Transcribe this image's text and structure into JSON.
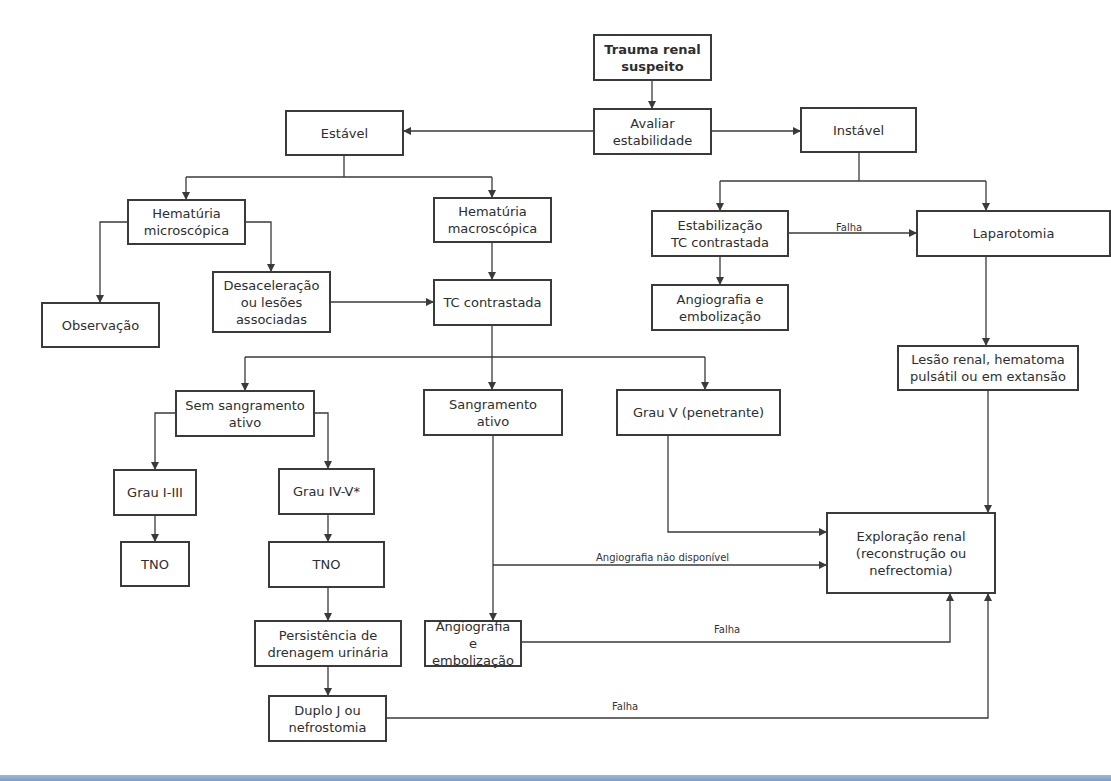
{
  "diagram": {
    "title": "Trauma renal suspeito",
    "nodes": {
      "trauma": {
        "label": "Trauma renal\nsuspeito",
        "x": 593,
        "y": 34,
        "w": 119,
        "h": 47,
        "bold": true
      },
      "avaliar": {
        "label": "Avaliar\nestabilidade",
        "x": 593,
        "y": 108,
        "w": 119,
        "h": 47
      },
      "estavel": {
        "label": "Estável",
        "x": 285,
        "y": 110,
        "w": 119,
        "h": 46
      },
      "instavel": {
        "label": "Instável",
        "x": 800,
        "y": 107,
        "w": 117,
        "h": 46
      },
      "hem_micro": {
        "label": "Hematúria\nmicroscópica",
        "x": 127,
        "y": 199,
        "w": 119,
        "h": 46
      },
      "hem_macro": {
        "label": "Hematúria\nmacroscópica",
        "x": 433,
        "y": 197,
        "w": 119,
        "h": 46
      },
      "observacao": {
        "label": "Observação",
        "x": 41,
        "y": 302,
        "w": 119,
        "h": 46
      },
      "desacel": {
        "label": "Desaceleração\nou lesões\nassociadas",
        "x": 212,
        "y": 271,
        "w": 119,
        "h": 62
      },
      "tc": {
        "label": "TC contrastada",
        "x": 433,
        "y": 279,
        "w": 119,
        "h": 47
      },
      "estab_tc": {
        "label": "Estabilização\nTC contrastada",
        "x": 651,
        "y": 210,
        "w": 138,
        "h": 47
      },
      "laparotomia": {
        "label": "Laparotomia",
        "x": 916,
        "y": 210,
        "w": 195,
        "h": 47
      },
      "angio1": {
        "label": "Angiografia e\nembolização",
        "x": 651,
        "y": 284,
        "w": 138,
        "h": 47
      },
      "lesao": {
        "label": "Lesão renal, hematoma\npulsátil ou em extansão",
        "x": 897,
        "y": 345,
        "w": 182,
        "h": 46
      },
      "sem_sangr": {
        "label": "Sem sangramento\nativo",
        "x": 175,
        "y": 390,
        "w": 140,
        "h": 47
      },
      "sangr_ativo": {
        "label": "Sangramento\nativo",
        "x": 423,
        "y": 389,
        "w": 140,
        "h": 47
      },
      "grau_v": {
        "label": "Grau V (penetrante)",
        "x": 616,
        "y": 389,
        "w": 165,
        "h": 47
      },
      "grau_1_3": {
        "label": "Grau I-III",
        "x": 113,
        "y": 469,
        "w": 84,
        "h": 47
      },
      "grau_4_5": {
        "label": "Grau IV-V*",
        "x": 278,
        "y": 468,
        "w": 97,
        "h": 47
      },
      "tno1": {
        "label": "TNO",
        "x": 120,
        "y": 541,
        "w": 70,
        "h": 46
      },
      "tno2": {
        "label": "TNO",
        "x": 268,
        "y": 541,
        "w": 117,
        "h": 47
      },
      "persist": {
        "label": "Persistência de\ndrenagem urinária",
        "x": 254,
        "y": 620,
        "w": 148,
        "h": 47
      },
      "angio2": {
        "label": "Angiografia e\nembolização",
        "x": 424,
        "y": 620,
        "w": 98,
        "h": 47
      },
      "duplo_j": {
        "label": "Duplo J ou\nnefrostomia",
        "x": 268,
        "y": 695,
        "w": 119,
        "h": 47
      },
      "exploracao": {
        "label": "Exploração renal\n(reconstrução ou\nnefrectomia)",
        "x": 826,
        "y": 512,
        "w": 170,
        "h": 82
      }
    },
    "edges": [
      {
        "id": "trauma-avaliar",
        "points": [
          [
            652,
            81
          ],
          [
            652,
            108
          ]
        ],
        "arrow": true
      },
      {
        "id": "avaliar-estavel",
        "points": [
          [
            593,
            131
          ],
          [
            404,
            131
          ]
        ],
        "arrow": true
      },
      {
        "id": "avaliar-instavel",
        "points": [
          [
            712,
            131
          ],
          [
            800,
            131
          ]
        ],
        "arrow": true
      },
      {
        "id": "estavel-split",
        "points": [
          [
            344,
            156
          ],
          [
            344,
            177
          ]
        ],
        "arrow": false
      },
      {
        "id": "estavel-branch",
        "points": [
          [
            186,
            177
          ],
          [
            492,
            177
          ]
        ],
        "arrow": false
      },
      {
        "id": "to-hem-micro",
        "points": [
          [
            186,
            177
          ],
          [
            186,
            199
          ]
        ],
        "arrow": true
      },
      {
        "id": "to-hem-macro",
        "points": [
          [
            492,
            177
          ],
          [
            492,
            197
          ]
        ],
        "arrow": true
      },
      {
        "id": "micro-obs",
        "points": [
          [
            127,
            222
          ],
          [
            100,
            222
          ],
          [
            100,
            302
          ]
        ],
        "arrow": true
      },
      {
        "id": "micro-desacel",
        "points": [
          [
            246,
            222
          ],
          [
            271,
            222
          ],
          [
            271,
            271
          ]
        ],
        "arrow": true
      },
      {
        "id": "desacel-tc",
        "points": [
          [
            331,
            302
          ],
          [
            433,
            302
          ]
        ],
        "arrow": true
      },
      {
        "id": "macro-tc",
        "points": [
          [
            492,
            243
          ],
          [
            492,
            279
          ]
        ],
        "arrow": true
      },
      {
        "id": "instavel-split",
        "points": [
          [
            859,
            153
          ],
          [
            859,
            181
          ]
        ],
        "arrow": false
      },
      {
        "id": "instavel-branch",
        "points": [
          [
            720,
            181
          ],
          [
            986,
            181
          ]
        ],
        "arrow": false
      },
      {
        "id": "to-estab",
        "points": [
          [
            720,
            181
          ],
          [
            720,
            210
          ]
        ],
        "arrow": true
      },
      {
        "id": "to-lapar",
        "points": [
          [
            986,
            181
          ],
          [
            986,
            210
          ]
        ],
        "arrow": true
      },
      {
        "id": "estab-lapar",
        "points": [
          [
            789,
            233
          ],
          [
            916,
            233
          ]
        ],
        "arrow": true,
        "label": "Falha",
        "label_x": 836,
        "label_y": 222
      },
      {
        "id": "estab-angio1",
        "points": [
          [
            720,
            257
          ],
          [
            720,
            284
          ]
        ],
        "arrow": true
      },
      {
        "id": "lapar-lesao",
        "points": [
          [
            986,
            257
          ],
          [
            986,
            345
          ]
        ],
        "arrow": true
      },
      {
        "id": "tc-down",
        "points": [
          [
            492,
            326
          ],
          [
            492,
            357
          ]
        ],
        "arrow": false
      },
      {
        "id": "tc-branch",
        "points": [
          [
            245,
            357
          ],
          [
            705,
            357
          ]
        ],
        "arrow": false
      },
      {
        "id": "to-sem",
        "points": [
          [
            245,
            357
          ],
          [
            245,
            390
          ]
        ],
        "arrow": true
      },
      {
        "id": "to-sangr",
        "points": [
          [
            492,
            357
          ],
          [
            492,
            389
          ]
        ],
        "arrow": true
      },
      {
        "id": "to-grau-v",
        "points": [
          [
            705,
            357
          ],
          [
            705,
            389
          ]
        ],
        "arrow": true
      },
      {
        "id": "sem-grau13",
        "points": [
          [
            175,
            413
          ],
          [
            155,
            413
          ],
          [
            155,
            469
          ]
        ],
        "arrow": true
      },
      {
        "id": "sem-grau45",
        "points": [
          [
            315,
            413
          ],
          [
            328,
            413
          ],
          [
            328,
            468
          ]
        ],
        "arrow": true
      },
      {
        "id": "grau13-tno1",
        "points": [
          [
            155,
            516
          ],
          [
            155,
            541
          ]
        ],
        "arrow": true
      },
      {
        "id": "grau45-tno2",
        "points": [
          [
            328,
            515
          ],
          [
            328,
            541
          ]
        ],
        "arrow": true
      },
      {
        "id": "tno2-persist",
        "points": [
          [
            328,
            588
          ],
          [
            328,
            620
          ]
        ],
        "arrow": true
      },
      {
        "id": "persist-duplo",
        "points": [
          [
            328,
            667
          ],
          [
            328,
            695
          ]
        ],
        "arrow": true
      },
      {
        "id": "sangr-angio2",
        "points": [
          [
            493,
            436
          ],
          [
            493,
            620
          ]
        ],
        "arrow": true
      },
      {
        "id": "angio-nao-disp",
        "points": [
          [
            493,
            565
          ],
          [
            826,
            565
          ]
        ],
        "arrow": true,
        "label": "Angiografia não disponível",
        "label_x": 596,
        "label_y": 552
      },
      {
        "id": "grau-v-explor",
        "points": [
          [
            668,
            436
          ],
          [
            668,
            532
          ],
          [
            826,
            532
          ]
        ],
        "arrow": true
      },
      {
        "id": "lesao-explor",
        "points": [
          [
            988,
            391
          ],
          [
            988,
            512
          ]
        ],
        "arrow": true
      },
      {
        "id": "angio2-explor",
        "points": [
          [
            522,
            642
          ],
          [
            950,
            642
          ],
          [
            950,
            594
          ]
        ],
        "arrow": true,
        "label": "Falha",
        "label_x": 714,
        "label_y": 624
      },
      {
        "id": "duplo-explor",
        "points": [
          [
            387,
            718
          ],
          [
            988,
            718
          ],
          [
            988,
            594
          ]
        ],
        "arrow": true,
        "label": "Falha",
        "label_x": 612,
        "label_y": 701
      }
    ]
  },
  "colors": {
    "line": "#3a3a3a",
    "box_border": "#3a3a3a",
    "text": "#2e2e2e",
    "bottom_bar": "#8aa8cc"
  }
}
